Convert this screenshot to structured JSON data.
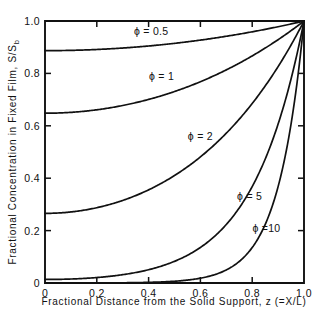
{
  "chart_data": {
    "type": "line",
    "title": "",
    "xlabel": "Fractional  Distance  from  the  Solid  Support,  z  (=X/L)",
    "ylabel": "Fractional  Concentration  in  Fixed  Film,  S/Sb",
    "ylabel_parts": {
      "main": "Fractional  Concentration  in   Fixed  Film,  S/S",
      "subscript": "b"
    },
    "xlim": [
      0,
      1
    ],
    "ylim": [
      0,
      1
    ],
    "grid": false,
    "legend_position": "inline-curve-labels",
    "xticks": [
      "0",
      "0.2",
      "0.4",
      "0.6",
      "0.8",
      "1.0"
    ],
    "xtick_values": [
      0,
      0.2,
      0.4,
      0.6,
      0.8,
      1.0
    ],
    "yticks": [
      "0",
      "0.2",
      "0.4",
      "0.6",
      "0.8",
      "1.0"
    ],
    "ytick_values": [
      0,
      0.2,
      0.4,
      0.6,
      0.8,
      1.0
    ],
    "formula": "S/Sb = cosh(phi*z) / cosh(phi)",
    "x": [
      0,
      0.05,
      0.1,
      0.15,
      0.2,
      0.25,
      0.3,
      0.35,
      0.4,
      0.45,
      0.5,
      0.55,
      0.6,
      0.65,
      0.7,
      0.75,
      0.8,
      0.85,
      0.9,
      0.95,
      1.0
    ],
    "series": [
      {
        "name": "phi = 0.5",
        "label": "ϕ = 0.5",
        "phi": 0.5,
        "label_x": 0.41,
        "label_y": 0.945,
        "values": [
          0.8868,
          0.8871,
          0.8879,
          0.8893,
          0.8912,
          0.8937,
          0.8967,
          0.9003,
          0.9044,
          0.9091,
          0.9143,
          0.9201,
          0.9265,
          0.9334,
          0.9409,
          0.949,
          0.9577,
          0.9669,
          0.9767,
          0.9871,
          1.0
        ]
      },
      {
        "name": "phi = 1",
        "label": "ϕ = 1",
        "phi": 1,
        "label_x": 0.45,
        "label_y": 0.775,
        "values": [
          0.6481,
          0.6489,
          0.6513,
          0.6554,
          0.6611,
          0.6684,
          0.6774,
          0.6881,
          0.7005,
          0.7146,
          0.7305,
          0.7482,
          0.7677,
          0.789,
          0.8123,
          0.8376,
          0.8648,
          0.8941,
          0.9255,
          0.9591,
          1.0
        ]
      },
      {
        "name": "phi = 2",
        "label": "ϕ = 2",
        "phi": 2,
        "label_x": 0.6,
        "label_y": 0.545,
        "values": [
          0.2658,
          0.2671,
          0.2711,
          0.2778,
          0.2873,
          0.2996,
          0.3148,
          0.3331,
          0.3545,
          0.3792,
          0.4073,
          0.4391,
          0.4748,
          0.5146,
          0.5588,
          0.6078,
          0.6618,
          0.7212,
          0.7866,
          0.8583,
          1.0
        ]
      },
      {
        "name": "phi = 5",
        "label": "ϕ = 5",
        "phi": 5,
        "label_x": 0.79,
        "label_y": 0.315,
        "values": [
          0.0135,
          0.0139,
          0.0152,
          0.0175,
          0.0211,
          0.0262,
          0.0334,
          0.0431,
          0.0562,
          0.0736,
          0.0965,
          0.1267,
          0.1665,
          0.2189,
          0.288,
          0.3791,
          0.4992,
          0.6576,
          0.8664,
          1.1417,
          1.0
        ]
      },
      {
        "name": "phi = 10",
        "label": "ϕ =10",
        "phi": 10,
        "label_x": 0.855,
        "label_y": 0.195,
        "values": [
          9e-05,
          0.00015,
          0.00025,
          0.00041,
          0.00067,
          0.0011,
          0.0018,
          0.003,
          0.005,
          0.0082,
          0.0135,
          0.0223,
          0.0368,
          0.0608,
          0.1003,
          0.1655,
          0.2732,
          0.4509,
          0.7444,
          1.2289,
          1.0
        ]
      }
    ],
    "annotations": [
      {
        "text": "ϕ = 0.5",
        "x": 0.41,
        "y": 0.945
      },
      {
        "text": "ϕ = 1",
        "x": 0.45,
        "y": 0.775
      },
      {
        "text": "ϕ = 2",
        "x": 0.6,
        "y": 0.545
      },
      {
        "text": "ϕ = 5",
        "x": 0.79,
        "y": 0.315
      },
      {
        "text": "ϕ =10",
        "x": 0.855,
        "y": 0.195
      }
    ]
  }
}
